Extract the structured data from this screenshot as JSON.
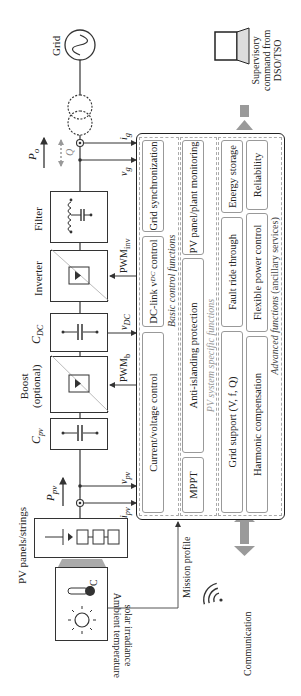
{
  "power_stage": {
    "pv_panels": "PV panels/strings",
    "cpv": "C",
    "cpv_sub": "pv",
    "boost": [
      "Boost",
      "(optional)"
    ],
    "cdc": "C",
    "cdc_sub": "DC",
    "inverter": "Inverter",
    "filter": "Filter",
    "grid": "Grid"
  },
  "signals": {
    "ppv": "P",
    "ppv_sub": "pv",
    "ipv": "i",
    "ipv_sub": "pv",
    "vpv": "v",
    "vpv_sub": "pv",
    "pwm_b": "PWM",
    "pwm_b_sub": "b",
    "vdc": "v",
    "vdc_sub": "DC",
    "pwm_inv": "PWM",
    "pwm_inv_sub": "inv",
    "vg": "v",
    "vg_sub": "g",
    "ig": "i",
    "ig_sub": "g",
    "po": "P",
    "po_sub": "o",
    "q": "Q"
  },
  "control": {
    "basic": {
      "label": "Basic control functions",
      "items": [
        "Current/voltage control",
        "DC-link v",
        "DC",
        " control",
        "Grid synchronization"
      ]
    },
    "pv_specific": {
      "label": "PV system specific functions",
      "items": [
        "MPPT",
        "Anti-islanding protection",
        "PV panel/plant monitoring"
      ]
    },
    "advanced": {
      "label_italic": "Advanced functions",
      "label_rest": " (ancillary services)",
      "row1": [
        "Grid support (V, f, Q)",
        "Fault ride through",
        "Energy storage"
      ],
      "row2": [
        "Harmonic compensation",
        "Flexible power control",
        "Reliability"
      ]
    }
  },
  "external": {
    "environment": [
      "Ambient temperature",
      "solar irradiance"
    ],
    "temp_unit": "°C",
    "mission_profile": "Mission profile",
    "communication": "Communication",
    "supervisory": [
      "Supervisory",
      "command from",
      "DSO/TSO"
    ]
  },
  "colors": {
    "line": "#333333",
    "gray_arrow": "#9a9a9a",
    "dashed": "#aaaaaa"
  }
}
